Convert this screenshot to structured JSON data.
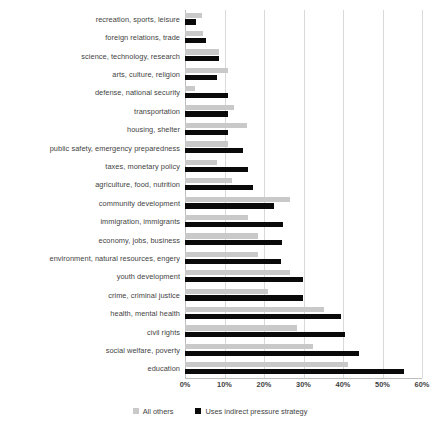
{
  "chart_data": {
    "type": "bar",
    "orientation": "horizontal",
    "title": "",
    "xlabel": "",
    "ylabel": "",
    "xlim": [
      0,
      60
    ],
    "xticks": [
      "0%",
      "10%",
      "20%",
      "30%",
      "40%",
      "50%",
      "60%"
    ],
    "xtick_values": [
      0,
      10,
      20,
      30,
      40,
      50,
      60
    ],
    "grid": true,
    "legend_position": "bottom",
    "categories": [
      "recreation, sports, leisure",
      "foreign relations, trade",
      "science, technology, research",
      "arts, culture, religion",
      "defense, national security",
      "transportation",
      "housing, shelter",
      "public safety, emergency preparedness",
      "taxes, monetary policy",
      "agriculture, food, nutrition",
      "community development",
      "immigration, immigrants",
      "economy, jobs, business",
      "environment, natural resources, engery",
      "youth development",
      "crime, criminal justice",
      "health, mental health",
      "civil rights",
      "social welfare, poverty",
      "education"
    ],
    "series": [
      {
        "name": "All others",
        "color": "#c9c9c9",
        "values": [
          4.3,
          4.6,
          8.6,
          10.9,
          2.5,
          12.4,
          15.7,
          10.9,
          8.1,
          11.9,
          26.6,
          16.0,
          18.5,
          18.5,
          26.6,
          21.0,
          35.2,
          28.4,
          32.4,
          41.3
        ]
      },
      {
        "name": "Uses indirect pressure strategy",
        "color": "#0a0a0a",
        "values": [
          2.8,
          5.3,
          8.6,
          8.1,
          10.9,
          10.9,
          10.9,
          14.7,
          16.0,
          17.2,
          22.5,
          24.8,
          24.6,
          24.3,
          29.9,
          29.9,
          39.5,
          40.5,
          44.1,
          55.4
        ]
      }
    ],
    "legend": [
      {
        "label": "All others",
        "color": "#c9c9c9"
      },
      {
        "label": "Uses indirect pressure strategy",
        "color": "#0a0a0a"
      }
    ]
  }
}
